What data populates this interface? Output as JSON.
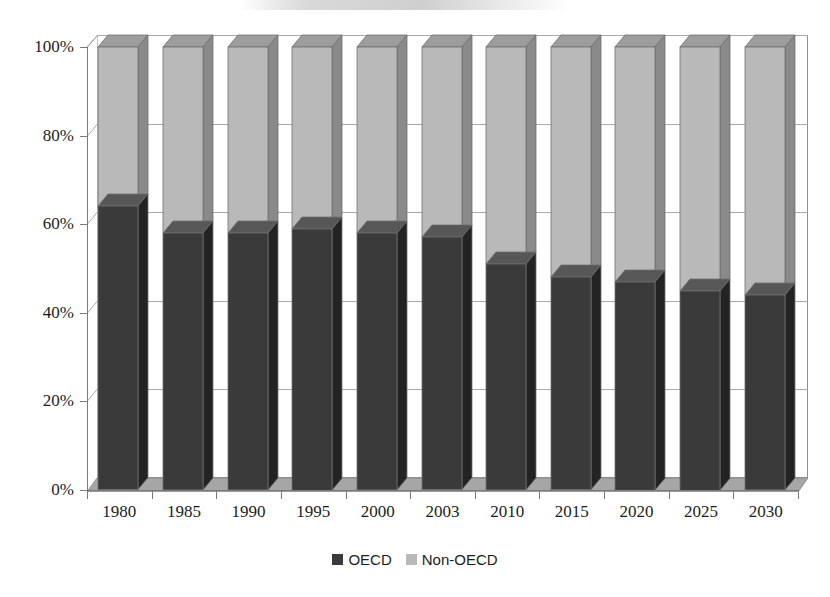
{
  "chart_data": {
    "type": "bar",
    "subtype": "stacked-100-percent-3d",
    "title": "",
    "xlabel": "",
    "ylabel": "",
    "categories": [
      "1980",
      "1985",
      "1990",
      "1995",
      "2000",
      "2003",
      "2010",
      "2015",
      "2020",
      "2025",
      "2030"
    ],
    "series": [
      {
        "name": "OECD",
        "color": "#3a3a3a",
        "values": [
          64,
          58,
          58,
          59,
          58,
          57,
          51,
          48,
          47,
          45,
          44
        ]
      },
      {
        "name": "Non-OECD",
        "color": "#b9b9b9",
        "values": [
          36,
          42,
          42,
          41,
          42,
          43,
          49,
          52,
          53,
          55,
          56
        ]
      }
    ],
    "ylim": [
      0,
      100
    ],
    "yticks": [
      0,
      20,
      40,
      60,
      80,
      100
    ],
    "ytick_labels": [
      "0%",
      "20%",
      "40%",
      "60%",
      "80%",
      "100%"
    ],
    "grid": true,
    "grid_axis": "y",
    "legend_position": "bottom"
  },
  "axes": {
    "y_labels": [
      "100%",
      "80%",
      "60%",
      "40%",
      "20%",
      "0%"
    ],
    "x_labels": [
      "1980",
      "1985",
      "1990",
      "1995",
      "2000",
      "2003",
      "2010",
      "2015",
      "2020",
      "2025",
      "2030"
    ]
  },
  "legend": {
    "items": [
      {
        "label": "OECD",
        "color": "#3a3a3a"
      },
      {
        "label": "Non-OECD",
        "color": "#b9b9b9"
      }
    ]
  },
  "colors": {
    "oecd_front": "#3a3a3a",
    "oecd_side": "#232323",
    "oecd_top": "#575757",
    "nonoecd_front": "#b9b9b9",
    "nonoecd_side": "#8a8a8a",
    "nonoecd_top": "#9d9d9d",
    "floor": "#a6a6a6",
    "grid": "#a9a9a9",
    "axis": "#7a7a7a",
    "text": "#1c1c1c",
    "background": "#ffffff"
  }
}
